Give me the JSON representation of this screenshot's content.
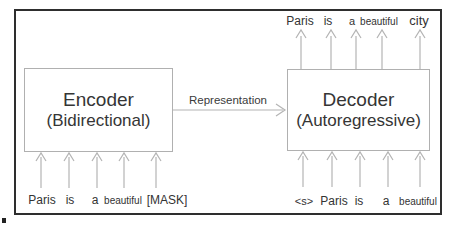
{
  "figure": {
    "encoder": {
      "title": "Encoder",
      "subtitle": "(Bidirectional)"
    },
    "decoder": {
      "title": "Decoder",
      "subtitle": "(Autoregressive)"
    },
    "representation_label": "Representation",
    "encoder_input_tokens": [
      "Paris",
      "is",
      "a",
      "beautiful",
      "[MASK]"
    ],
    "decoder_input_tokens": [
      "<s>",
      "Paris",
      "is",
      "a",
      "beautiful"
    ],
    "decoder_output_tokens": [
      "Paris",
      "is",
      "a",
      "beautiful",
      "city"
    ],
    "colors": {
      "frame_border": "#2e2e2e",
      "box_border": "#b0b0b0",
      "arrow": "#b4b4b4",
      "text": "#353535",
      "background": "#ffffff"
    }
  }
}
